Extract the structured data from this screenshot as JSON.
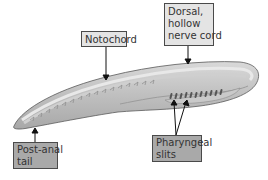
{
  "diagram": {
    "labels": {
      "notochord": {
        "text": "Notochord"
      },
      "dorsal_nerve_cord": {
        "lines": [
          "Dorsal,",
          "hollow",
          "nerve cord"
        ]
      },
      "post_anal_tail": {
        "lines": [
          "Post-anal",
          "tail"
        ]
      },
      "pharyngeal_slits": {
        "lines": [
          "Pharyngeal",
          "slits"
        ]
      }
    },
    "colors": {
      "light_box": "#e4e4e4",
      "dark_box": "#a9a9a9",
      "body_outer": "#bdbdbd",
      "body_inner": "#d6d6d6",
      "slits": "#555555",
      "arrow": "#111111"
    }
  }
}
